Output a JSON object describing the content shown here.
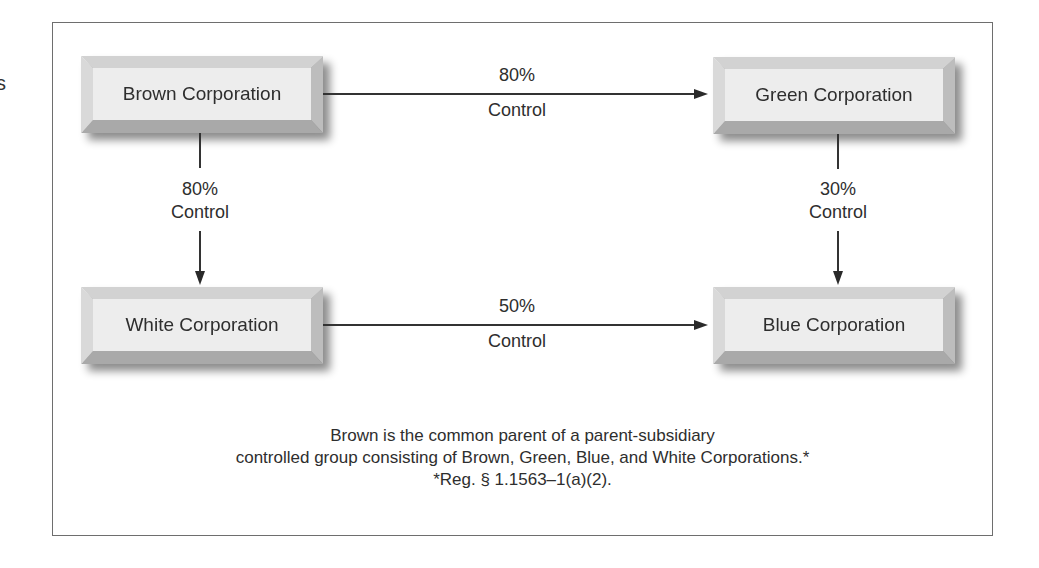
{
  "edge_fragment": "s",
  "nodes": {
    "brown": {
      "label": "Brown Corporation"
    },
    "green": {
      "label": "Green Corporation"
    },
    "white": {
      "label": "White Corporation"
    },
    "blue": {
      "label": "Blue Corporation"
    }
  },
  "edges": {
    "brown_to_green": {
      "from": "Brown Corporation",
      "to": "Green Corporation",
      "percent": "80%",
      "type": "Control"
    },
    "brown_to_white": {
      "from": "Brown Corporation",
      "to": "White Corporation",
      "percent": "80%",
      "type": "Control"
    },
    "green_to_blue": {
      "from": "Green Corporation",
      "to": "Blue Corporation",
      "percent": "30%",
      "type": "Control"
    },
    "white_to_blue": {
      "from": "White Corporation",
      "to": "Blue Corporation",
      "percent": "50%",
      "type": "Control"
    }
  },
  "caption": {
    "line1": "Brown is the common parent of a parent-subsidiary",
    "line2": "controlled group consisting of Brown, Green, Blue, and White Corporations.*",
    "footnote": "*Reg. § 1.1563–1(a)(2)."
  },
  "colors": {
    "frame_border": "#6e6e6e",
    "node_face": "#ededed",
    "line": "#333333"
  }
}
